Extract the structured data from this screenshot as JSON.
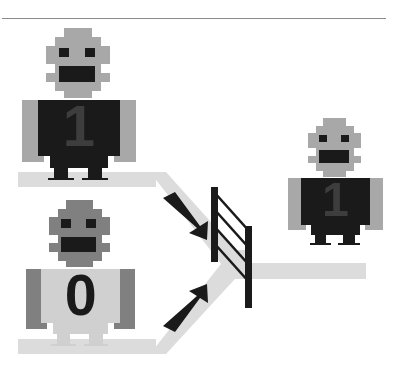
{
  "scene": {
    "title": "robot-merge-diagram",
    "background_color": "#ffffff",
    "rule_color": "#8c8c8c"
  },
  "palette": {
    "black": "#1a1a1a",
    "dark_gray": "#808080",
    "mid_gray": "#a8a8a8",
    "light_gray": "#d9d9d9",
    "path_gray": "#dcdcdc",
    "white": "#ffffff"
  },
  "robots": [
    {
      "id": "robot-top-left",
      "label": "1",
      "label_color": "#1a1a1a",
      "body_color": "#1a1a1a",
      "head_color": "#a8a8a8",
      "arm_color": "#a8a8a8",
      "leg_color": "#1a1a1a",
      "digit_color": "#3d3d3d",
      "position": "upper-left-track"
    },
    {
      "id": "robot-bottom-left",
      "label": "0",
      "label_color": "#1a1a1a",
      "body_color": "#d0d0d0",
      "head_color": "#808080",
      "arm_color": "#808080",
      "leg_color": "#d0d0d0",
      "digit_color": "#1a1a1a",
      "position": "lower-left-track"
    },
    {
      "id": "robot-right",
      "label": "1",
      "label_color": "#1a1a1a",
      "body_color": "#1a1a1a",
      "head_color": "#a8a8a8",
      "arm_color": "#a8a8a8",
      "leg_color": "#1a1a1a",
      "digit_color": "#3d3d3d",
      "position": "output-track"
    }
  ],
  "tracks": [
    {
      "id": "track-upper-left",
      "color": "#dcdcdc"
    },
    {
      "id": "track-lower-left",
      "color": "#dcdcdc"
    },
    {
      "id": "track-merge-chevron",
      "color": "#dcdcdc"
    },
    {
      "id": "track-output-right",
      "color": "#dcdcdc"
    }
  ],
  "arrows": [
    {
      "id": "arrow-upper",
      "direction": "down-right",
      "color": "#1a1a1a"
    },
    {
      "id": "arrow-lower",
      "direction": "up-right",
      "color": "#1a1a1a"
    }
  ],
  "gate": {
    "id": "merge-gate",
    "post_color": "#1a1a1a",
    "rail_color": "#1a1a1a",
    "rail_count": 4,
    "post_count": 2
  }
}
